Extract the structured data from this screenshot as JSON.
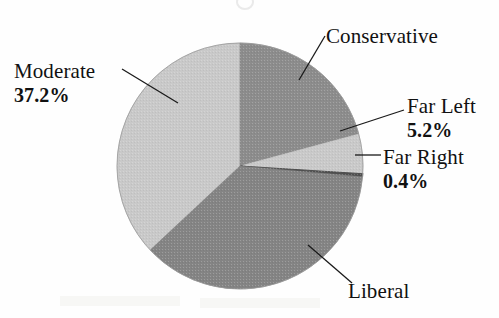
{
  "chart_data": {
    "type": "pie",
    "title": "",
    "categories": [
      "Conservative",
      "Far Left",
      "Far Right",
      "Liberal",
      "Moderate"
    ],
    "values": [
      20.8,
      5.2,
      0.4,
      36.4,
      37.2
    ],
    "labels_shown": [
      "Conservative",
      "Far Left",
      "Far Right",
      "Liberal",
      "Moderate"
    ],
    "value_labels_shown": [
      "",
      "5.2%",
      "0.4%",
      "",
      "37.2%"
    ],
    "legend": "none",
    "grid": false,
    "start_angle_deg": 0,
    "direction": "clockwise",
    "slices": [
      {
        "name": "Conservative",
        "percent_label": "",
        "value": 20.8,
        "color": "#8c8c8c",
        "start_deg": 0,
        "end_deg": 74.9
      },
      {
        "name": "Far Left",
        "percent_label": "5.2%",
        "value": 5.2,
        "color": "#c9c9c9",
        "start_deg": 74.9,
        "end_deg": 93.6
      },
      {
        "name": "Far Right",
        "percent_label": "0.4%",
        "value": 0.4,
        "color": "#4f4f4f",
        "start_deg": 93.6,
        "end_deg": 95.0
      },
      {
        "name": "Liberal",
        "percent_label": "",
        "value": 36.4,
        "color": "#848484",
        "start_deg": 95.0,
        "end_deg": 226.9
      },
      {
        "name": "Moderate",
        "percent_label": "37.2%",
        "value": 37.2,
        "color": "#c9c9c9",
        "start_deg": 226.9,
        "end_deg": 360
      }
    ],
    "geometry": {
      "center_x": 240,
      "center_y": 166,
      "radius": 123
    }
  },
  "labels": {
    "moderate": {
      "name": "Moderate",
      "pct": "37.2%"
    },
    "conservative": {
      "name": "Conservative",
      "pct": ""
    },
    "far_left": {
      "name": "Far Left",
      "pct": "5.2%"
    },
    "far_right": {
      "name": "Far Right",
      "pct": "0.4%"
    },
    "liberal": {
      "name": "Liberal",
      "pct": ""
    }
  },
  "colors": {
    "light_gray": "#c9c9c9",
    "mid_gray": "#8c8c8c",
    "dark_gray": "#848484",
    "very_dark_gray": "#4f4f4f",
    "leader_line": "#1a1a1a",
    "background": "#ffffff",
    "text": "#111111"
  }
}
